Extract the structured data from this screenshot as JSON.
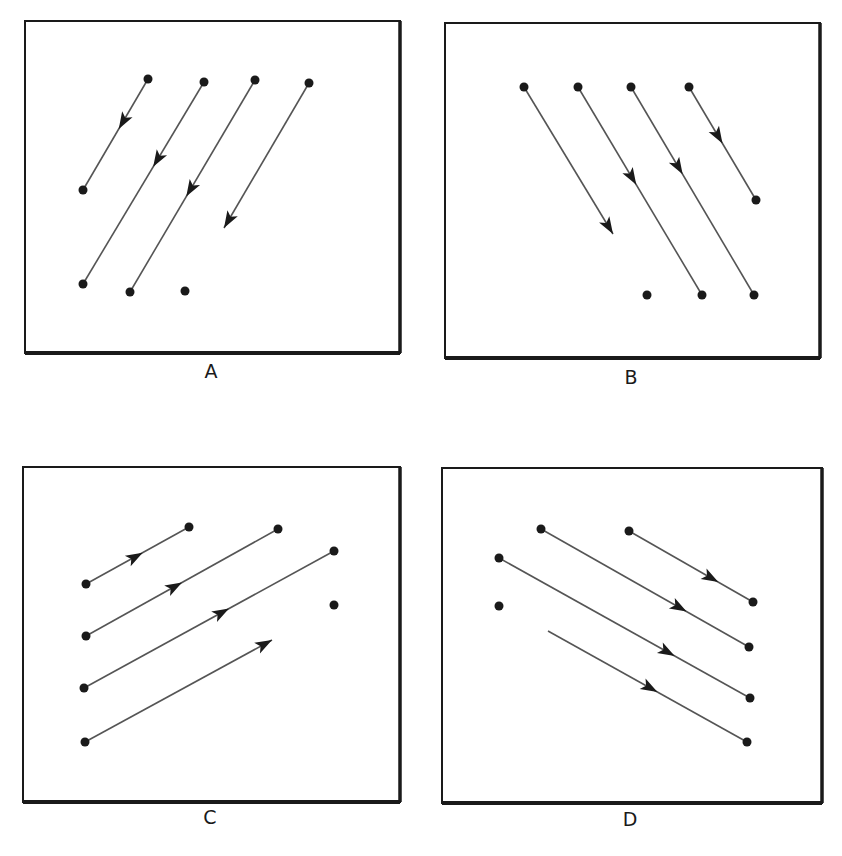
{
  "colors": {
    "frame": "#1a1a1a",
    "line": "#555555",
    "dot": "#1a1a1a",
    "arrowhead": "#1a1a1a",
    "background": "#ffffff"
  },
  "panels": [
    {
      "label": "A",
      "frame": {
        "x": 25,
        "y": 21,
        "w": 375,
        "h": 332
      },
      "label_pos": {
        "x": 211,
        "y": 372
      },
      "vectors": [
        {
          "from": [
            148,
            79
          ],
          "to": [
            83,
            190
          ],
          "arrow_at": 0.45,
          "start_dot": true,
          "end_dot": true
        },
        {
          "from": [
            204,
            82
          ],
          "to": [
            83,
            284
          ],
          "arrow_at": 0.42,
          "start_dot": true,
          "end_dot": true
        },
        {
          "from": [
            255,
            80
          ],
          "to": [
            130,
            292
          ],
          "arrow_at": 0.55,
          "start_dot": true,
          "end_dot": true
        },
        {
          "from": [
            309,
            83
          ],
          "to": [
            224,
            228
          ],
          "arrow_at": 1.0,
          "start_dot": true,
          "end_dot": false
        }
      ],
      "dots": [
        [
          185,
          291
        ]
      ]
    },
    {
      "label": "B",
      "frame": {
        "x": 445,
        "y": 23,
        "w": 375,
        "h": 335
      },
      "label_pos": {
        "x": 631,
        "y": 378
      },
      "vectors": [
        {
          "from": [
            524,
            87
          ],
          "to": [
            613,
            234
          ],
          "arrow_at": 1.0,
          "start_dot": true,
          "end_dot": false
        },
        {
          "from": [
            578,
            87
          ],
          "to": [
            702,
            295
          ],
          "arrow_at": 0.47,
          "start_dot": true,
          "end_dot": true
        },
        {
          "from": [
            631,
            87
          ],
          "to": [
            754,
            295
          ],
          "arrow_at": 0.42,
          "start_dot": true,
          "end_dot": true
        },
        {
          "from": [
            689,
            87
          ],
          "to": [
            756,
            200
          ],
          "arrow_at": 0.5,
          "start_dot": true,
          "end_dot": true
        }
      ],
      "dots": [
        [
          647,
          295
        ]
      ]
    },
    {
      "label": "C",
      "frame": {
        "x": 23,
        "y": 467,
        "w": 377,
        "h": 335
      },
      "label_pos": {
        "x": 210,
        "y": 818
      },
      "vectors": [
        {
          "from": [
            86,
            584
          ],
          "to": [
            189,
            527
          ],
          "arrow_at": 0.55,
          "start_dot": true,
          "end_dot": true
        },
        {
          "from": [
            86,
            636
          ],
          "to": [
            278,
            529
          ],
          "arrow_at": 0.5,
          "start_dot": true,
          "end_dot": true
        },
        {
          "from": [
            84,
            688
          ],
          "to": [
            334,
            551
          ],
          "arrow_at": 0.58,
          "start_dot": true,
          "end_dot": true
        },
        {
          "from": [
            85,
            742
          ],
          "to": [
            272,
            640
          ],
          "arrow_at": 1.0,
          "start_dot": true,
          "end_dot": false
        }
      ],
      "dots": [
        [
          334,
          605
        ]
      ]
    },
    {
      "label": "D",
      "frame": {
        "x": 442,
        "y": 468,
        "w": 380,
        "h": 335
      },
      "label_pos": {
        "x": 630,
        "y": 820
      },
      "vectors": [
        {
          "from": [
            629,
            531
          ],
          "to": [
            753,
            602
          ],
          "arrow_at": 0.72,
          "start_dot": true,
          "end_dot": true
        },
        {
          "from": [
            541,
            529
          ],
          "to": [
            749,
            647
          ],
          "arrow_at": 0.7,
          "start_dot": true,
          "end_dot": true
        },
        {
          "from": [
            499,
            558
          ],
          "to": [
            750,
            698
          ],
          "arrow_at": 0.7,
          "start_dot": true,
          "end_dot": true
        },
        {
          "from": [
            548,
            631
          ],
          "to": [
            747,
            742
          ],
          "arrow_at": 0.55,
          "start_dot": false,
          "end_dot": true
        }
      ],
      "dots": [
        [
          499,
          606
        ]
      ]
    }
  ]
}
